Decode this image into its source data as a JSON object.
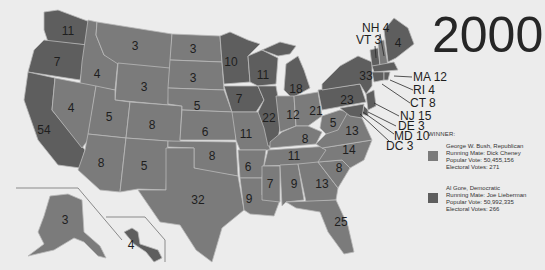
{
  "title": "2000",
  "colors": {
    "republican": "#7b7b7b",
    "democratic": "#5e5e5e",
    "background": "#ececec",
    "state_border": "#b9b9b9"
  },
  "legend": {
    "heading": "WINNER:",
    "entries": [
      {
        "party": "republican",
        "line1": "George W. Bush, Republican",
        "line2": "Running Mate: Dick Cheney",
        "line3": "Popular Vote: 50,455,156",
        "line4": "Electoral Votes: 271"
      },
      {
        "party": "democratic",
        "line1": "Al Gore, Democratic",
        "line2": "Running Mate: Joe Lieberman",
        "line3": "Popular Vote: 50,992,335",
        "line4": "Electoral Votes: 266"
      }
    ]
  },
  "states": {
    "WA": "11",
    "OR": "7",
    "CA": "54",
    "ID": "4",
    "NV": "4",
    "MT": "3",
    "WY": "3",
    "UT": "5",
    "AZ": "8",
    "CO": "8",
    "NM": "5",
    "ND": "3",
    "SD": "3",
    "NE": "5",
    "KS": "6",
    "OK": "8",
    "TX": "32",
    "MN": "10",
    "IA": "7",
    "MO": "11",
    "AR": "6",
    "LA": "9",
    "WI": "11",
    "IL": "22",
    "MI": "18",
    "IN": "12",
    "OH": "21",
    "KY": "8",
    "TN": "11",
    "MS": "7",
    "AL": "9",
    "GA": "13",
    "FL": "25",
    "SC": "8",
    "NC": "14",
    "VA": "13",
    "WV": "5",
    "PA": "23",
    "NY": "33",
    "ME": "4",
    "AK": "3",
    "HI": "4"
  },
  "callouts": {
    "NH": "NH 4",
    "VT": "VT 3",
    "MA": "MA 12",
    "RI": "RI 4",
    "CT": "CT 8",
    "NJ": "NJ 15",
    "DE": "DE 3",
    "MD": "MD 10",
    "DC": "DC 3"
  }
}
